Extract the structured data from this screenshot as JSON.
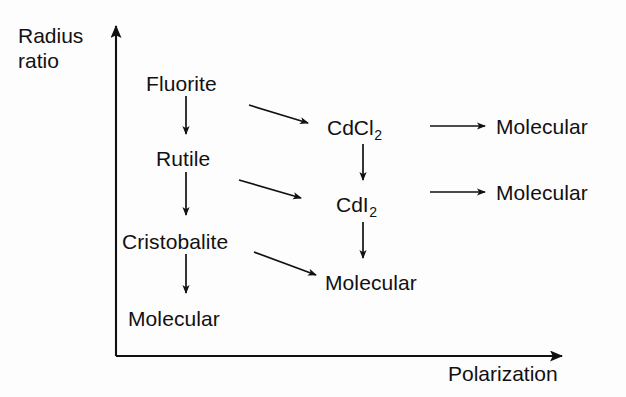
{
  "figure": {
    "kind": "flow-diagram",
    "background_color": "#fdfdfd",
    "ink_color": "#111111"
  },
  "axes": {
    "y": {
      "label": "Radius\nratio",
      "label_line1": "Radius",
      "label_line2": "ratio",
      "direction": "up",
      "x": 116,
      "top": 18,
      "bottom": 356
    },
    "x": {
      "label": "Polarization",
      "direction": "right",
      "y": 356,
      "left": 116,
      "right": 574
    }
  },
  "nodes": [
    {
      "id": "fluorite",
      "label": "Fluorite",
      "x": 146,
      "y": 73,
      "column": 1
    },
    {
      "id": "rutile",
      "label": "Rutile",
      "x": 156,
      "y": 148,
      "column": 1
    },
    {
      "id": "cristobalite",
      "label": "Cristobalite",
      "x": 122,
      "y": 231,
      "column": 1
    },
    {
      "id": "molecular-left",
      "label": "Molecular",
      "x": 128,
      "y": 308,
      "column": 1
    },
    {
      "id": "cdcl2",
      "base": "CdCl",
      "sub": "2",
      "label": "CdCl2",
      "x": 327,
      "y": 116,
      "column": 2
    },
    {
      "id": "cdi2",
      "base": "CdI",
      "sub": "2",
      "label": "CdI2",
      "x": 336,
      "y": 193,
      "column": 2
    },
    {
      "id": "molecular-mid",
      "label": "Molecular",
      "x": 325,
      "y": 272,
      "column": 2
    },
    {
      "id": "molecular-top-right",
      "label": "Molecular",
      "x": 496,
      "y": 116,
      "column": 3
    },
    {
      "id": "molecular-bottom-right",
      "label": "Molecular",
      "x": 496,
      "y": 182,
      "column": 3
    }
  ],
  "arrows": [
    {
      "id": "fluorite-to-rutile",
      "from": "fluorite",
      "to": "rutile",
      "x1": 186,
      "y1": 96,
      "x2": 186,
      "y2": 138,
      "style": "vertical"
    },
    {
      "id": "rutile-to-cristobalite",
      "from": "rutile",
      "to": "cristobalite",
      "x1": 186,
      "y1": 172,
      "x2": 186,
      "y2": 219,
      "style": "vertical"
    },
    {
      "id": "cristobalite-to-molecular",
      "from": "cristobalite",
      "to": "molecular-left",
      "x1": 186,
      "y1": 254,
      "x2": 186,
      "y2": 297,
      "style": "vertical"
    },
    {
      "id": "fluorite-to-cdcl2",
      "from": "fluorite",
      "to": "cdcl2",
      "x1": 249,
      "y1": 105,
      "x2": 314,
      "y2": 125,
      "style": "diagonal"
    },
    {
      "id": "rutile-to-cdi2",
      "from": "rutile",
      "to": "cdi2",
      "x1": 239,
      "y1": 180,
      "x2": 307,
      "y2": 200,
      "style": "diagonal"
    },
    {
      "id": "cristobalite-to-molecular-mid",
      "from": "cristobalite",
      "to": "molecular-mid",
      "x1": 254,
      "y1": 252,
      "x2": 322,
      "y2": 277,
      "style": "diagonal"
    },
    {
      "id": "cdcl2-to-cdi2",
      "from": "cdcl2",
      "to": "cdi2",
      "x1": 363,
      "y1": 144,
      "x2": 363,
      "y2": 184,
      "style": "vertical"
    },
    {
      "id": "cdi2-to-molecular-mid",
      "from": "cdi2",
      "to": "molecular-mid",
      "x1": 363,
      "y1": 222,
      "x2": 363,
      "y2": 262,
      "style": "vertical"
    },
    {
      "id": "cdcl2-to-molecular",
      "from": "cdcl2",
      "to": "molecular-top-right",
      "x1": 430,
      "y1": 126,
      "x2": 489,
      "y2": 126,
      "style": "horizontal"
    },
    {
      "id": "cdi2-to-molecular",
      "from": "cdi2",
      "to": "molecular-bottom-right",
      "x1": 430,
      "y1": 192,
      "x2": 489,
      "y2": 192,
      "style": "horizontal"
    }
  ]
}
